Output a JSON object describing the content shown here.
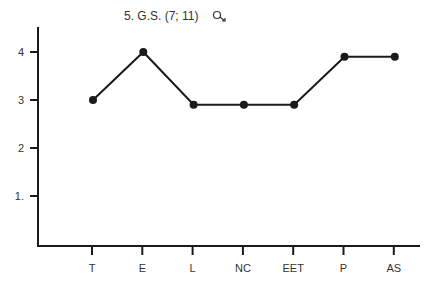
{
  "chart_data": {
    "type": "line",
    "title": "5. G.S. (7; 11)",
    "title_symbol": "male-symbol",
    "xlabel": "",
    "ylabel": "",
    "categories": [
      "T",
      "E",
      "L",
      "NC",
      "EET",
      "P",
      "AS"
    ],
    "series": [
      {
        "name": "G.S.",
        "values": [
          3.0,
          4.0,
          2.9,
          2.9,
          2.9,
          3.9,
          3.9
        ]
      }
    ],
    "y_ticks": [
      1,
      2,
      3,
      4
    ],
    "y_tick_labels": [
      "1.",
      "2",
      "3",
      "4"
    ],
    "ylim": [
      0,
      4.5
    ],
    "grid": false,
    "legend": "none",
    "colors": {
      "line": "#1a1a1a",
      "text": "#333333"
    }
  }
}
